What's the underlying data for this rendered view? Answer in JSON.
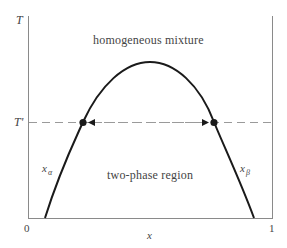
{
  "figure": {
    "axes": {
      "y_label": "T",
      "y_marker_label": "T'",
      "x_label": "x",
      "x_tick_min": "0",
      "x_tick_max": "1"
    },
    "regions": {
      "upper": "homogeneous mixture",
      "lower": "two-phase region"
    },
    "curves": {
      "left_branch_label": "x",
      "left_branch_subscript": "α",
      "right_branch_label": "x",
      "right_branch_subscript": "β"
    },
    "tie_line": {
      "label": "T'",
      "left_point_x": 0.227,
      "right_point_x": 0.762
    },
    "colors": {
      "curve": "#1a1a1a",
      "axes": "#8a8a8a",
      "dashed_line": "#9a9a9a",
      "text": "#444444",
      "background": "#ffffff"
    }
  }
}
